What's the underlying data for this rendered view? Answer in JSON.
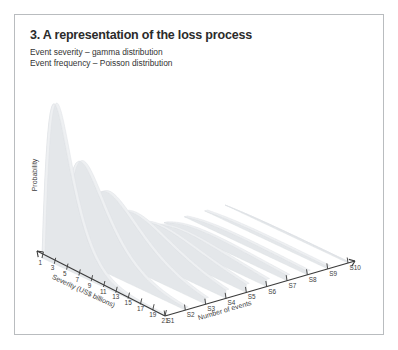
{
  "figure": {
    "title": "3. A representation of the loss process",
    "subtitles": [
      "Event severity – gamma distribution",
      "Event frequency – Poisson distribution"
    ]
  },
  "chart_data": {
    "type": "area",
    "title": "3. A representation of the loss process",
    "subtitle": "Event severity – gamma distribution / Event frequency – Poisson distribution",
    "xlabel": "Severity (US$ billions)",
    "zlabel": "Number of events",
    "ylabel": "Probability",
    "grid": false,
    "legend": "none",
    "projection": "3d-ridgeline",
    "x_ticks": [
      1,
      3,
      5,
      7,
      9,
      11,
      13,
      15,
      17,
      19,
      21
    ],
    "x_range": [
      1,
      21
    ],
    "z_ticks": [
      "S1",
      "S2",
      "S3",
      "S4",
      "S5",
      "S6",
      "S7",
      "S8",
      "S9",
      "S10"
    ],
    "y_axis_ticks_shown": false,
    "series": [
      {
        "name": "S1",
        "peak_probability": 1.0,
        "peak_severity": 3.0,
        "shape": "gamma"
      },
      {
        "name": "S2",
        "peak_probability": 0.62,
        "peak_severity": 4.0,
        "shape": "gamma"
      },
      {
        "name": "S3",
        "peak_probability": 0.41,
        "peak_severity": 5.0,
        "shape": "gamma"
      },
      {
        "name": "S4",
        "peak_probability": 0.26,
        "peak_severity": 6.0,
        "shape": "gamma"
      },
      {
        "name": "S5",
        "peak_probability": 0.16,
        "peak_severity": 7.0,
        "shape": "gamma"
      },
      {
        "name": "S6",
        "peak_probability": 0.1,
        "peak_severity": 8.0,
        "shape": "gamma"
      },
      {
        "name": "S7",
        "peak_probability": 0.06,
        "peak_severity": 9.0,
        "shape": "gamma"
      },
      {
        "name": "S8",
        "peak_probability": 0.035,
        "peak_severity": 10.0,
        "shape": "gamma"
      },
      {
        "name": "S9",
        "peak_probability": 0.02,
        "peak_severity": 11.0,
        "shape": "gamma"
      },
      {
        "name": "S10",
        "peak_probability": 0.012,
        "peak_severity": 12.0,
        "shape": "gamma"
      }
    ],
    "colors": {
      "ribbon_front": "#e4e7ea",
      "ribbon_top": "#eef0f2",
      "axis": "#3a3a3a",
      "text": "#3c3c3c",
      "frame": "#b9bcbf"
    }
  }
}
